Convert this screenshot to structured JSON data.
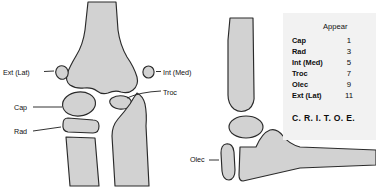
{
  "figure": {
    "views": {
      "ap": {
        "name": "ap-elbow-view",
        "labels": {
          "ext_lat": "Ext (Lat)",
          "cap": "Cap",
          "rad": "Rad",
          "int_med": "Int (Med)",
          "troc": "Troc"
        }
      },
      "lateral": {
        "name": "lateral-elbow-view",
        "labels": {
          "olec": "Olec"
        }
      }
    },
    "legend": {
      "header_blank": "",
      "header_age": "Appear",
      "rows": [
        {
          "name": "Cap",
          "age": "1"
        },
        {
          "name": "Rad",
          "age": "3"
        },
        {
          "name": "Int (Med)",
          "age": "5"
        },
        {
          "name": "Troc",
          "age": "7"
        },
        {
          "name": "Olec",
          "age": "9"
        },
        {
          "name": "Ext (Lat)",
          "age": "11"
        }
      ],
      "mnemonic": "C. R. I. T. O. E."
    },
    "colors": {
      "bone_fill": "#d2d2d2",
      "bone_outline": "#2a2a2a",
      "legend_background": "#f2f2f2",
      "page_background": "#ffffff",
      "text": "#111111"
    }
  }
}
